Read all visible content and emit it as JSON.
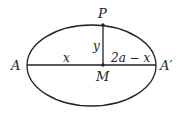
{
  "diagram": {
    "colors": {
      "stroke": "#222222",
      "background": "#ffffff"
    },
    "ellipse": {
      "cx": 91.5,
      "cy": 65.5,
      "rx": 64.5,
      "ry": 40.5
    },
    "points": {
      "A": {
        "label": "A",
        "x": 27,
        "y": 65
      },
      "A_prime": {
        "label": "A′",
        "x": 156,
        "y": 65
      },
      "M": {
        "label": "M",
        "x": 103,
        "y": 65
      },
      "P": {
        "label": "P",
        "x": 103,
        "y": 25
      }
    },
    "segment_labels": {
      "AM": "x",
      "MA_prime": "2a − x",
      "PM": "y"
    }
  }
}
